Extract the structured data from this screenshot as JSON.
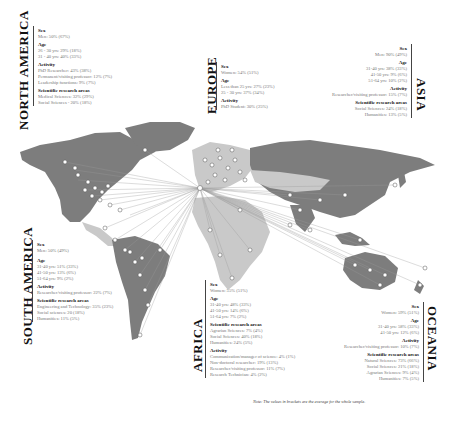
{
  "figure": {
    "note": "Note: The values in brackets are the average for the whole sample.",
    "hub": {
      "x": 200,
      "y": 188
    },
    "colors": {
      "land_dark": "#7d7d7d",
      "land_light": "#c9c9c9",
      "line": "#9a9a9a",
      "marker": "#ffffff",
      "marker_stroke": "#555555",
      "text_value": "#777777",
      "text_head": "#111111"
    }
  },
  "regions": {
    "north_america": {
      "name": "NORTH AMERICA",
      "sections": [
        {
          "heading": "Sex",
          "values": [
            "Men: 50% (67%)"
          ]
        },
        {
          "heading": "Age",
          "values": [
            "26 - 30 yrs: 29% (18%)",
            "31 - 40 yrs: 40% (33%)"
          ]
        },
        {
          "heading": "Activity",
          "values": [
            "PhD Researcher: 43% (38%)",
            "Permanent/visiting professor: 12% (7%)",
            "Leadership functions: 9% (7%)"
          ]
        },
        {
          "heading": "Scientific research areas",
          "values": [
            "Medical Sciences: 32% (29%)",
            "Social Sciences - 20% (18%)"
          ]
        }
      ]
    },
    "europe": {
      "name": "EUROPE",
      "sections": [
        {
          "heading": "Sex",
          "values": [
            "Women: 54% (51%)"
          ]
        },
        {
          "heading": "Age",
          "values": [
            "Less than 25 yrs: 27% (23%)",
            "25 - 30 yrs: 37% (34%)"
          ]
        },
        {
          "heading": "Activity",
          "values": [
            "PhD Student: 30% (25%)"
          ]
        }
      ]
    },
    "asia": {
      "name": "ASIA",
      "sections": [
        {
          "heading": "Sex",
          "values": [
            "Men: 90% (49%)"
          ]
        },
        {
          "heading": "Age",
          "values": [
            "31-40 yrs: 38% (33%)",
            "41-50 yrs: 9% (6%)",
            "51-64 yrs: 10% (2%)"
          ]
        },
        {
          "heading": "Activity",
          "values": [
            "Researcher/visiting professor: 15% (7%)"
          ]
        },
        {
          "heading": "Scientific research areas",
          "values": [
            "Social Sciences: 24% (18%)",
            "Humanities: 13% (5%)"
          ]
        }
      ]
    },
    "south_america": {
      "name": "SOUTH AMERICA",
      "sections": [
        {
          "heading": "Sex",
          "values": [
            "Men: 50% (49%)"
          ]
        },
        {
          "heading": "Age",
          "values": [
            "31-40 yrs: 51% (33%)",
            "41-50 yrs: 13% (6%)",
            "51-64 yrs: 9% (2%)"
          ]
        },
        {
          "heading": "Activity",
          "values": [
            "Researcher/visiting professor: 22% (7%)"
          ]
        },
        {
          "heading": "Scientific research areas",
          "values": [
            "Engineering and Technology: 35% (23%)",
            "Social sciences: 20 (18%)",
            "Humanities: 11% (5%)"
          ]
        }
      ]
    },
    "africa": {
      "name": "AFRICA",
      "sections": [
        {
          "heading": "Sex",
          "values": [
            "Women: 55% (51%)"
          ]
        },
        {
          "heading": "Age",
          "values": [
            "31-40 yrs: 48% (33%)",
            "41-50 yrs: 14% (6%)",
            "51-64 yrs: 7% (2%)"
          ]
        },
        {
          "heading": "Scientific research areas",
          "values": [
            "Agrarian Sciences: 7% (4%)",
            "Social Sciences: 40% (18%)",
            "Humanities: 24% (5%)"
          ]
        },
        {
          "heading": "Activity",
          "values": [
            "Communication/manager of science: 4% (1%)",
            "Non-doctoral researcher: 19% (13%)",
            "Researcher/visiting professor: 11% (7%)",
            "Research Technician: 4% (2%)"
          ]
        }
      ]
    },
    "oceania": {
      "name": "OCEANIA",
      "sections": [
        {
          "heading": "Sex",
          "values": [
            "Women: 59% (51%)"
          ]
        },
        {
          "heading": "Age",
          "values": [
            "31-40 yrs: 58% (33%)",
            "41-50 yrs: 12% (6%)"
          ]
        },
        {
          "heading": "Activity",
          "values": [
            "Researcher/visiting professor: 10% (7%)"
          ]
        },
        {
          "heading": "Scientific research areas",
          "values": [
            "Natural Sciences: 73% (66%)",
            "Social Sciences: 21% (18%)",
            "Agrarian Sciences: 9% (4%)",
            "Humanities: 7% (5%)"
          ]
        }
      ]
    }
  }
}
